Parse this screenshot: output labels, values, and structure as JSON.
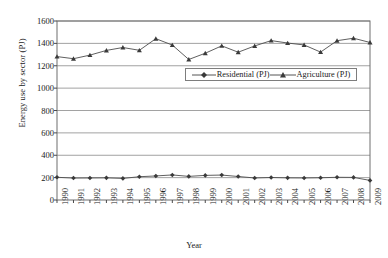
{
  "chart_data": {
    "type": "line",
    "title": "",
    "xlabel": "Year",
    "ylabel": "Energy use by sector (PJ)",
    "x": [
      1990,
      1991,
      1992,
      1993,
      1994,
      1995,
      1996,
      1997,
      1998,
      1999,
      2000,
      2001,
      2002,
      2003,
      2004,
      2005,
      2006,
      2007,
      2008,
      2009
    ],
    "xtick_labels": [
      "1990",
      "1991",
      "1992",
      "1993",
      "1994",
      "1995",
      "1996",
      "1997",
      "1998",
      "1999",
      "2000",
      "2001",
      "2002",
      "2003",
      "2004",
      "2005",
      "2006",
      "2007",
      "2008",
      "2009"
    ],
    "ylim": [
      0,
      1600
    ],
    "ytick_labels": [
      "0",
      "200",
      "400",
      "600",
      "800",
      "1000",
      "1200",
      "1400",
      "1600"
    ],
    "yticks": [
      0,
      200,
      400,
      600,
      800,
      1000,
      1200,
      1400,
      1600
    ],
    "grid": "horizontal",
    "legend_position": "upper-center",
    "series": [
      {
        "name": "Residential (PJ)",
        "marker": "diamond",
        "color": "#4d4d4d",
        "values": [
          203,
          196,
          197,
          198,
          193,
          208,
          215,
          224,
          211,
          220,
          223,
          210,
          197,
          201,
          198,
          197,
          199,
          203,
          202,
          175
        ]
      },
      {
        "name": "Agriculture (PJ)",
        "marker": "triangle",
        "color": "#4d4d4d",
        "values": [
          1282,
          1263,
          1295,
          1337,
          1363,
          1338,
          1442,
          1385,
          1256,
          1312,
          1378,
          1321,
          1377,
          1425,
          1403,
          1386,
          1322,
          1424,
          1446,
          1408
        ]
      }
    ]
  },
  "axes": {
    "y_axis_label": "Energy use by sector (PJ)",
    "x_axis_label": "Year"
  },
  "legend": {
    "items": [
      {
        "label": "Residential (PJ)",
        "marker": "diamond-marker-icon"
      },
      {
        "label": "Agriculture (PJ)",
        "marker": "triangle-marker-icon"
      }
    ]
  }
}
